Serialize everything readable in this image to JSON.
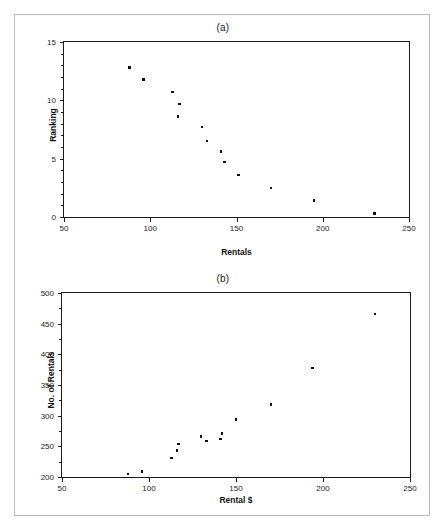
{
  "figure": {
    "border_color": "#b9b9b9",
    "marker_color": "#111111",
    "axis_color": "#1a1a1a"
  },
  "chart_data": [
    {
      "type": "scatter",
      "title": "(a)",
      "xlabel": "Rentals",
      "ylabel": "Ranking",
      "xlim": [
        50,
        250
      ],
      "ylim": [
        0,
        15
      ],
      "xticks": [
        50,
        100,
        150,
        200,
        250
      ],
      "yticks": [
        0,
        5,
        10,
        15
      ],
      "y_minor_tick_step": 1,
      "grid": false,
      "legend": false,
      "points": [
        {
          "x": 88,
          "y": 12.8
        },
        {
          "x": 96,
          "y": 11.8
        },
        {
          "x": 113,
          "y": 10.7
        },
        {
          "x": 117,
          "y": 9.7
        },
        {
          "x": 116,
          "y": 8.6
        },
        {
          "x": 130,
          "y": 7.7
        },
        {
          "x": 133,
          "y": 6.5
        },
        {
          "x": 141,
          "y": 5.6
        },
        {
          "x": 143,
          "y": 4.7
        },
        {
          "x": 151,
          "y": 3.6
        },
        {
          "x": 170,
          "y": 2.5
        },
        {
          "x": 195,
          "y": 1.4
        },
        {
          "x": 230,
          "y": 0.3
        }
      ]
    },
    {
      "type": "scatter",
      "title": "(b)",
      "xlabel": "Rental $",
      "ylabel": "No. of Rentals",
      "xlim": [
        50,
        250
      ],
      "ylim": [
        200,
        500
      ],
      "xticks": [
        50,
        100,
        150,
        200,
        250
      ],
      "yticks": [
        200,
        250,
        300,
        350,
        400,
        450,
        500
      ],
      "y_minor_tick_step": 25,
      "grid": false,
      "legend": false,
      "points": [
        {
          "x": 88,
          "y": 205
        },
        {
          "x": 96,
          "y": 209
        },
        {
          "x": 113,
          "y": 231
        },
        {
          "x": 116,
          "y": 243
        },
        {
          "x": 117,
          "y": 254
        },
        {
          "x": 130,
          "y": 266
        },
        {
          "x": 133,
          "y": 259
        },
        {
          "x": 141,
          "y": 262
        },
        {
          "x": 142,
          "y": 271
        },
        {
          "x": 150,
          "y": 294
        },
        {
          "x": 170,
          "y": 318
        },
        {
          "x": 194,
          "y": 378
        },
        {
          "x": 230,
          "y": 466
        }
      ]
    }
  ]
}
